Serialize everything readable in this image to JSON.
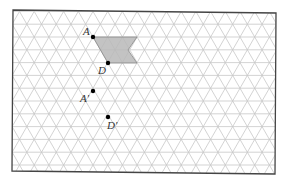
{
  "diagram": {
    "type": "isometric-grid-translation",
    "grid": {
      "line_color": "#c8c8c8",
      "frame_color": "#444444",
      "unit": 14.7,
      "row_height": 12.8
    },
    "shape": {
      "fill": "#b9b9b9",
      "stroke": "#888888",
      "vertices_label": [
        "A",
        "D"
      ]
    },
    "points": [
      {
        "label": "A",
        "x": 93,
        "y": 37
      },
      {
        "label": "D",
        "x": 108,
        "y": 63
      },
      {
        "label": "A'",
        "x": 93,
        "y": 91
      },
      {
        "label": "D'",
        "x": 108,
        "y": 117
      }
    ],
    "labels": {
      "A": "A",
      "D": "D",
      "A_prime": "A'",
      "D_prime": "D'"
    }
  }
}
